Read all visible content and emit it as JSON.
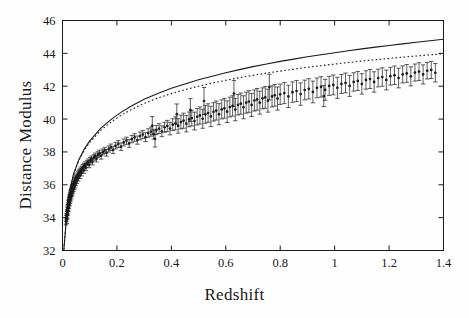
{
  "figure": {
    "background": "#fefefe",
    "ink_color": "#1a1a1a",
    "axis_label_x": "Redshift",
    "axis_label_y": "Distance Modulus"
  },
  "chart_data": {
    "type": "scatter",
    "title": "",
    "xlabel": "Redshift",
    "ylabel": "Distance Modulus",
    "xlim": [
      0,
      1.4
    ],
    "ylim": [
      32,
      46
    ],
    "xticks": [
      0,
      0.2,
      0.4,
      0.6,
      0.8,
      1.0,
      1.2,
      1.4
    ],
    "xticklabels": [
      "0",
      "0.2",
      "0.4",
      "0.6",
      "0.8",
      "1",
      "1.2",
      "1.4"
    ],
    "yticks": [
      32,
      34,
      36,
      38,
      40,
      42,
      44,
      46
    ],
    "yticklabels": [
      "32",
      "34",
      "36",
      "38",
      "40",
      "42",
      "44",
      "46"
    ],
    "grid": false,
    "legend": "none",
    "tick_direction": "in",
    "frame": "box",
    "marker": "point-with-vertical-errorbar",
    "errorbar_caps": true,
    "series": [
      {
        "name": "solid-model-curve",
        "style": "solid",
        "x": [
          0.005,
          0.02,
          0.04,
          0.06,
          0.08,
          0.1,
          0.14,
          0.18,
          0.22,
          0.26,
          0.3,
          0.35,
          0.4,
          0.45,
          0.5,
          0.55,
          0.6,
          0.65,
          0.7,
          0.75,
          0.8,
          0.85,
          0.9,
          0.95,
          1.0,
          1.05,
          1.1,
          1.15,
          1.2,
          1.25,
          1.3,
          1.35,
          1.4
        ],
        "y": [
          32.05,
          35.1,
          36.63,
          37.53,
          38.17,
          38.67,
          39.43,
          40.0,
          40.47,
          40.86,
          41.2,
          41.56,
          41.87,
          42.14,
          42.39,
          42.61,
          42.82,
          43.01,
          43.19,
          43.35,
          43.51,
          43.65,
          43.79,
          43.92,
          44.04,
          44.16,
          44.27,
          44.38,
          44.48,
          44.58,
          44.68,
          44.77,
          44.86
        ]
      },
      {
        "name": "dotted-model-curve",
        "style": "dotted",
        "x": [
          0.005,
          0.02,
          0.04,
          0.06,
          0.08,
          0.1,
          0.14,
          0.18,
          0.22,
          0.26,
          0.3,
          0.35,
          0.4,
          0.45,
          0.5,
          0.55,
          0.6,
          0.65,
          0.7,
          0.75,
          0.8,
          0.85,
          0.9,
          0.95,
          1.0,
          1.05,
          1.1,
          1.15,
          1.2,
          1.25,
          1.3,
          1.35,
          1.4
        ],
        "y": [
          32.05,
          35.09,
          36.6,
          37.48,
          38.1,
          38.58,
          39.3,
          39.84,
          40.28,
          40.64,
          40.95,
          41.28,
          41.55,
          41.79,
          42.0,
          42.19,
          42.36,
          42.52,
          42.66,
          42.8,
          42.92,
          43.04,
          43.15,
          43.25,
          43.35,
          43.44,
          43.53,
          43.61,
          43.69,
          43.77,
          43.84,
          43.91,
          43.98
        ]
      }
    ],
    "points": [
      {
        "x": 0.013,
        "y": 33.78,
        "e": 0.22
      },
      {
        "x": 0.014,
        "y": 33.95,
        "e": 0.2
      },
      {
        "x": 0.015,
        "y": 34.06,
        "e": 0.19
      },
      {
        "x": 0.016,
        "y": 34.2,
        "e": 0.21
      },
      {
        "x": 0.016,
        "y": 33.88,
        "e": 0.24
      },
      {
        "x": 0.017,
        "y": 34.32,
        "e": 0.18
      },
      {
        "x": 0.018,
        "y": 34.44,
        "e": 0.2
      },
      {
        "x": 0.018,
        "y": 34.15,
        "e": 0.22
      },
      {
        "x": 0.019,
        "y": 34.55,
        "e": 0.17
      },
      {
        "x": 0.02,
        "y": 34.62,
        "e": 0.19
      },
      {
        "x": 0.02,
        "y": 34.38,
        "e": 0.21
      },
      {
        "x": 0.021,
        "y": 34.72,
        "e": 0.18
      },
      {
        "x": 0.022,
        "y": 34.84,
        "e": 0.2
      },
      {
        "x": 0.022,
        "y": 34.58,
        "e": 0.22
      },
      {
        "x": 0.023,
        "y": 34.93,
        "e": 0.17
      },
      {
        "x": 0.024,
        "y": 35.02,
        "e": 0.19
      },
      {
        "x": 0.024,
        "y": 34.75,
        "e": 0.21
      },
      {
        "x": 0.025,
        "y": 35.1,
        "e": 0.16
      },
      {
        "x": 0.026,
        "y": 35.18,
        "e": 0.18
      },
      {
        "x": 0.026,
        "y": 34.92,
        "e": 0.2
      },
      {
        "x": 0.027,
        "y": 35.25,
        "e": 0.17
      },
      {
        "x": 0.028,
        "y": 35.32,
        "e": 0.19
      },
      {
        "x": 0.028,
        "y": 35.08,
        "e": 0.21
      },
      {
        "x": 0.029,
        "y": 35.4,
        "e": 0.16
      },
      {
        "x": 0.03,
        "y": 35.46,
        "e": 0.18
      },
      {
        "x": 0.03,
        "y": 35.22,
        "e": 0.2
      },
      {
        "x": 0.031,
        "y": 35.52,
        "e": 0.17
      },
      {
        "x": 0.032,
        "y": 35.58,
        "e": 0.18
      },
      {
        "x": 0.032,
        "y": 35.34,
        "e": 0.2
      },
      {
        "x": 0.033,
        "y": 35.64,
        "e": 0.16
      },
      {
        "x": 0.034,
        "y": 35.7,
        "e": 0.18
      },
      {
        "x": 0.034,
        "y": 35.47,
        "e": 0.19
      },
      {
        "x": 0.035,
        "y": 35.75,
        "e": 0.17
      },
      {
        "x": 0.036,
        "y": 35.8,
        "e": 0.18
      },
      {
        "x": 0.036,
        "y": 35.57,
        "e": 0.2
      },
      {
        "x": 0.037,
        "y": 35.86,
        "e": 0.16
      },
      {
        "x": 0.038,
        "y": 35.9,
        "e": 0.17
      },
      {
        "x": 0.038,
        "y": 35.68,
        "e": 0.19
      },
      {
        "x": 0.039,
        "y": 35.95,
        "e": 0.16
      },
      {
        "x": 0.04,
        "y": 36.0,
        "e": 0.18
      },
      {
        "x": 0.04,
        "y": 35.78,
        "e": 0.19
      },
      {
        "x": 0.042,
        "y": 36.08,
        "e": 0.17
      },
      {
        "x": 0.043,
        "y": 35.88,
        "e": 0.18
      },
      {
        "x": 0.044,
        "y": 36.15,
        "e": 0.16
      },
      {
        "x": 0.045,
        "y": 36.22,
        "e": 0.17
      },
      {
        "x": 0.046,
        "y": 35.99,
        "e": 0.19
      },
      {
        "x": 0.047,
        "y": 36.28,
        "e": 0.16
      },
      {
        "x": 0.048,
        "y": 36.34,
        "e": 0.17
      },
      {
        "x": 0.049,
        "y": 36.12,
        "e": 0.18
      },
      {
        "x": 0.05,
        "y": 36.4,
        "e": 0.16
      },
      {
        "x": 0.052,
        "y": 36.47,
        "e": 0.17
      },
      {
        "x": 0.053,
        "y": 36.26,
        "e": 0.18
      },
      {
        "x": 0.055,
        "y": 36.55,
        "e": 0.16
      },
      {
        "x": 0.057,
        "y": 36.62,
        "e": 0.17
      },
      {
        "x": 0.058,
        "y": 36.41,
        "e": 0.18
      },
      {
        "x": 0.06,
        "y": 36.7,
        "e": 0.16
      },
      {
        "x": 0.062,
        "y": 36.77,
        "e": 0.17
      },
      {
        "x": 0.064,
        "y": 36.56,
        "e": 0.18
      },
      {
        "x": 0.066,
        "y": 36.84,
        "e": 0.16
      },
      {
        "x": 0.068,
        "y": 36.91,
        "e": 0.17
      },
      {
        "x": 0.07,
        "y": 36.72,
        "e": 0.18
      },
      {
        "x": 0.072,
        "y": 36.98,
        "e": 0.16
      },
      {
        "x": 0.075,
        "y": 37.06,
        "e": 0.17
      },
      {
        "x": 0.078,
        "y": 36.88,
        "e": 0.18
      },
      {
        "x": 0.08,
        "y": 37.14,
        "e": 0.16
      },
      {
        "x": 0.083,
        "y": 37.22,
        "e": 0.17
      },
      {
        "x": 0.086,
        "y": 37.04,
        "e": 0.18
      },
      {
        "x": 0.09,
        "y": 37.31,
        "e": 0.16
      },
      {
        "x": 0.094,
        "y": 37.4,
        "e": 0.17
      },
      {
        "x": 0.098,
        "y": 37.22,
        "e": 0.18
      },
      {
        "x": 0.102,
        "y": 37.49,
        "e": 0.17
      },
      {
        "x": 0.106,
        "y": 37.57,
        "e": 0.18
      },
      {
        "x": 0.11,
        "y": 37.4,
        "e": 0.19
      },
      {
        "x": 0.115,
        "y": 37.66,
        "e": 0.17
      },
      {
        "x": 0.12,
        "y": 37.75,
        "e": 0.18
      },
      {
        "x": 0.125,
        "y": 37.58,
        "e": 0.19
      },
      {
        "x": 0.13,
        "y": 37.83,
        "e": 0.18
      },
      {
        "x": 0.136,
        "y": 37.92,
        "e": 0.19
      },
      {
        "x": 0.142,
        "y": 37.76,
        "e": 0.2
      },
      {
        "x": 0.148,
        "y": 38.0,
        "e": 0.18
      },
      {
        "x": 0.155,
        "y": 38.09,
        "e": 0.19
      },
      {
        "x": 0.162,
        "y": 37.94,
        "e": 0.2
      },
      {
        "x": 0.17,
        "y": 38.18,
        "e": 0.19
      },
      {
        "x": 0.178,
        "y": 38.28,
        "e": 0.2
      },
      {
        "x": 0.186,
        "y": 38.12,
        "e": 0.22
      },
      {
        "x": 0.195,
        "y": 38.38,
        "e": 0.2
      },
      {
        "x": 0.205,
        "y": 38.48,
        "e": 0.21
      },
      {
        "x": 0.215,
        "y": 38.32,
        "e": 0.23
      },
      {
        "x": 0.225,
        "y": 38.58,
        "e": 0.21
      },
      {
        "x": 0.235,
        "y": 38.68,
        "e": 0.22
      },
      {
        "x": 0.245,
        "y": 38.52,
        "e": 0.24
      },
      {
        "x": 0.255,
        "y": 38.78,
        "e": 0.22
      },
      {
        "x": 0.265,
        "y": 38.88,
        "e": 0.23
      },
      {
        "x": 0.275,
        "y": 38.72,
        "e": 0.25
      },
      {
        "x": 0.285,
        "y": 38.97,
        "e": 0.24
      },
      {
        "x": 0.295,
        "y": 39.06,
        "e": 0.25
      },
      {
        "x": 0.305,
        "y": 38.9,
        "e": 0.27
      },
      {
        "x": 0.315,
        "y": 39.15,
        "e": 0.26
      },
      {
        "x": 0.325,
        "y": 39.24,
        "e": 0.28
      },
      {
        "x": 0.335,
        "y": 39.08,
        "e": 0.3
      },
      {
        "x": 0.345,
        "y": 39.33,
        "e": 0.28
      },
      {
        "x": 0.355,
        "y": 39.42,
        "e": 0.3
      },
      {
        "x": 0.365,
        "y": 39.26,
        "e": 0.33
      },
      {
        "x": 0.375,
        "y": 39.5,
        "e": 0.31
      },
      {
        "x": 0.33,
        "y": 39.6,
        "e": 0.55
      },
      {
        "x": 0.34,
        "y": 38.8,
        "e": 0.5
      },
      {
        "x": 0.385,
        "y": 39.58,
        "e": 0.34
      },
      {
        "x": 0.395,
        "y": 39.42,
        "e": 0.38
      },
      {
        "x": 0.405,
        "y": 39.66,
        "e": 0.36
      },
      {
        "x": 0.415,
        "y": 39.74,
        "e": 0.4
      },
      {
        "x": 0.42,
        "y": 40.3,
        "e": 0.62
      },
      {
        "x": 0.425,
        "y": 39.58,
        "e": 0.44
      },
      {
        "x": 0.435,
        "y": 39.82,
        "e": 0.42
      },
      {
        "x": 0.445,
        "y": 39.9,
        "e": 0.46
      },
      {
        "x": 0.455,
        "y": 39.72,
        "e": 0.5
      },
      {
        "x": 0.465,
        "y": 39.98,
        "e": 0.45
      },
      {
        "x": 0.47,
        "y": 40.55,
        "e": 0.7
      },
      {
        "x": 0.475,
        "y": 40.06,
        "e": 0.48
      },
      {
        "x": 0.485,
        "y": 39.88,
        "e": 0.54
      },
      {
        "x": 0.495,
        "y": 40.14,
        "e": 0.5
      },
      {
        "x": 0.505,
        "y": 40.22,
        "e": 0.52
      },
      {
        "x": 0.515,
        "y": 40.02,
        "e": 0.58
      },
      {
        "x": 0.52,
        "y": 41.1,
        "e": 0.82
      },
      {
        "x": 0.525,
        "y": 40.29,
        "e": 0.54
      },
      {
        "x": 0.535,
        "y": 40.37,
        "e": 0.56
      },
      {
        "x": 0.545,
        "y": 40.16,
        "e": 0.62
      },
      {
        "x": 0.555,
        "y": 40.44,
        "e": 0.56
      },
      {
        "x": 0.565,
        "y": 40.52,
        "e": 0.58
      },
      {
        "x": 0.575,
        "y": 40.3,
        "e": 0.64
      },
      {
        "x": 0.585,
        "y": 40.59,
        "e": 0.58
      },
      {
        "x": 0.595,
        "y": 40.66,
        "e": 0.6
      },
      {
        "x": 0.605,
        "y": 40.45,
        "e": 0.66
      },
      {
        "x": 0.615,
        "y": 40.73,
        "e": 0.6
      },
      {
        "x": 0.625,
        "y": 40.8,
        "e": 0.62
      },
      {
        "x": 0.63,
        "y": 41.55,
        "e": 0.8
      },
      {
        "x": 0.635,
        "y": 40.58,
        "e": 0.68
      },
      {
        "x": 0.645,
        "y": 40.87,
        "e": 0.62
      },
      {
        "x": 0.655,
        "y": 40.94,
        "e": 0.64
      },
      {
        "x": 0.665,
        "y": 40.72,
        "e": 0.7
      },
      {
        "x": 0.675,
        "y": 41.0,
        "e": 0.64
      },
      {
        "x": 0.685,
        "y": 41.07,
        "e": 0.66
      },
      {
        "x": 0.695,
        "y": 40.86,
        "e": 0.7
      },
      {
        "x": 0.705,
        "y": 41.13,
        "e": 0.64
      },
      {
        "x": 0.715,
        "y": 41.2,
        "e": 0.66
      },
      {
        "x": 0.725,
        "y": 41.0,
        "e": 0.7
      },
      {
        "x": 0.735,
        "y": 41.26,
        "e": 0.64
      },
      {
        "x": 0.745,
        "y": 41.32,
        "e": 0.66
      },
      {
        "x": 0.755,
        "y": 41.12,
        "e": 0.7
      },
      {
        "x": 0.76,
        "y": 41.95,
        "e": 0.78
      },
      {
        "x": 0.77,
        "y": 41.38,
        "e": 0.64
      },
      {
        "x": 0.78,
        "y": 41.45,
        "e": 0.66
      },
      {
        "x": 0.79,
        "y": 41.25,
        "e": 0.7
      },
      {
        "x": 0.8,
        "y": 41.51,
        "e": 0.62
      },
      {
        "x": 0.815,
        "y": 41.58,
        "e": 0.64
      },
      {
        "x": 0.83,
        "y": 41.38,
        "e": 0.68
      },
      {
        "x": 0.845,
        "y": 41.64,
        "e": 0.62
      },
      {
        "x": 0.86,
        "y": 41.71,
        "e": 0.64
      },
      {
        "x": 0.875,
        "y": 41.52,
        "e": 0.68
      },
      {
        "x": 0.89,
        "y": 41.77,
        "e": 0.6
      },
      {
        "x": 0.905,
        "y": 41.84,
        "e": 0.62
      },
      {
        "x": 0.92,
        "y": 41.65,
        "e": 0.66
      },
      {
        "x": 0.935,
        "y": 41.9,
        "e": 0.6
      },
      {
        "x": 0.95,
        "y": 41.96,
        "e": 0.62
      },
      {
        "x": 0.96,
        "y": 41.4,
        "e": 0.64
      },
      {
        "x": 0.965,
        "y": 41.78,
        "e": 0.64
      },
      {
        "x": 0.98,
        "y": 42.02,
        "e": 0.58
      },
      {
        "x": 0.995,
        "y": 42.08,
        "e": 0.6
      },
      {
        "x": 1.01,
        "y": 41.9,
        "e": 0.64
      },
      {
        "x": 1.025,
        "y": 42.14,
        "e": 0.58
      },
      {
        "x": 1.04,
        "y": 42.2,
        "e": 0.6
      },
      {
        "x": 1.055,
        "y": 42.02,
        "e": 0.64
      },
      {
        "x": 1.07,
        "y": 42.26,
        "e": 0.56
      },
      {
        "x": 1.085,
        "y": 42.32,
        "e": 0.58
      },
      {
        "x": 1.1,
        "y": 42.14,
        "e": 0.62
      },
      {
        "x": 1.115,
        "y": 42.38,
        "e": 0.56
      },
      {
        "x": 1.13,
        "y": 42.44,
        "e": 0.58
      },
      {
        "x": 1.145,
        "y": 42.26,
        "e": 0.62
      },
      {
        "x": 1.16,
        "y": 42.5,
        "e": 0.54
      },
      {
        "x": 1.175,
        "y": 42.56,
        "e": 0.56
      },
      {
        "x": 1.19,
        "y": 42.38,
        "e": 0.6
      },
      {
        "x": 1.205,
        "y": 42.61,
        "e": 0.54
      },
      {
        "x": 1.22,
        "y": 42.67,
        "e": 0.56
      },
      {
        "x": 1.235,
        "y": 42.5,
        "e": 0.6
      },
      {
        "x": 1.25,
        "y": 42.72,
        "e": 0.52
      },
      {
        "x": 1.265,
        "y": 42.78,
        "e": 0.54
      },
      {
        "x": 1.28,
        "y": 42.6,
        "e": 0.58
      },
      {
        "x": 1.295,
        "y": 42.83,
        "e": 0.52
      },
      {
        "x": 1.31,
        "y": 42.89,
        "e": 0.54
      },
      {
        "x": 1.325,
        "y": 42.72,
        "e": 0.58
      },
      {
        "x": 1.34,
        "y": 42.94,
        "e": 0.5
      },
      {
        "x": 1.355,
        "y": 42.99,
        "e": 0.52
      },
      {
        "x": 1.37,
        "y": 42.82,
        "e": 0.56
      }
    ]
  }
}
